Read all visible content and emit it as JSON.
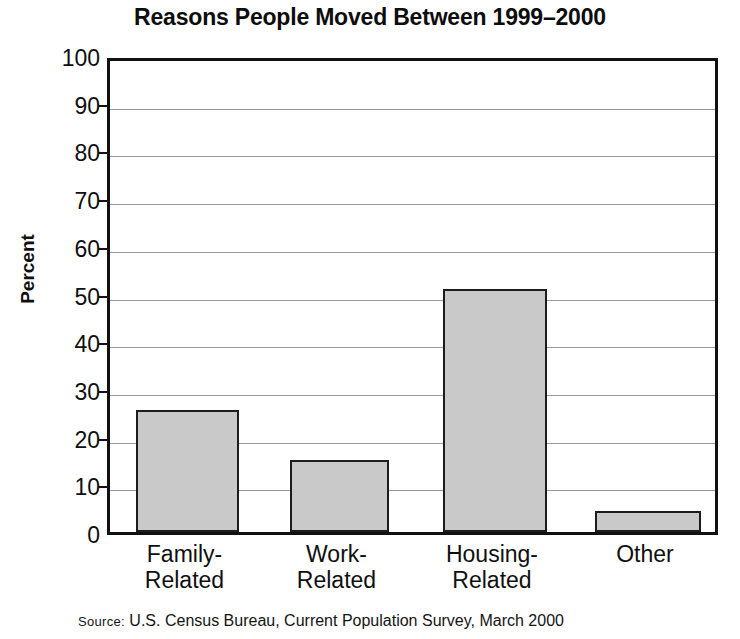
{
  "chart_data": {
    "type": "bar",
    "title": "Reasons People Moved Between 1999–2000",
    "subtitle": "",
    "xlabel": "",
    "ylabel": "Percent",
    "categories": [
      "Family-\nRelated",
      "Work-\nRelated",
      "Housing-\nRelated",
      "Other"
    ],
    "values": [
      25.5,
      15,
      51,
      4.5
    ],
    "ylim": [
      0,
      100
    ],
    "ytick_labels": [
      "100",
      "90",
      "80",
      "70",
      "60",
      "50",
      "40",
      "30",
      "20",
      "10",
      "0"
    ],
    "ytick_values": [
      100,
      90,
      80,
      70,
      60,
      50,
      40,
      30,
      20,
      10,
      0
    ],
    "grid": true,
    "legend": "none",
    "bar_color": "#c9c9c9",
    "bar_edge_color": "#1c1c1c",
    "grid_color": "#9a9a9a",
    "axis_color": "#111111",
    "background": "#ffffff"
  },
  "source": {
    "label": "Source:",
    "text": "U.S. Census Bureau, Current Population Survey, March 2000"
  }
}
